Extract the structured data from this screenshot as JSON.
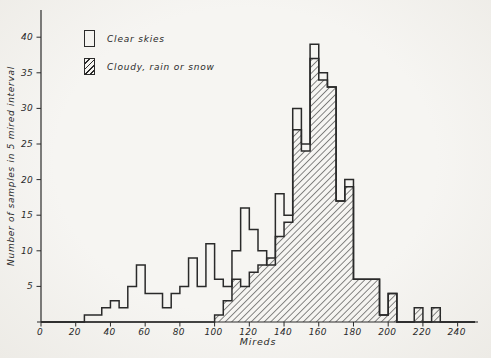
{
  "figure": {
    "ink": "#2a2a2a",
    "paper": "#f3f2ee"
  },
  "legend": {
    "items": [
      {
        "label": "Clear skies",
        "swatch": "open"
      },
      {
        "label": "Cloudy, rain or snow",
        "swatch": "hatched"
      }
    ]
  },
  "chart_data": {
    "type": "bar",
    "subtype": "overlaid step histograms",
    "title": "",
    "xlabel": "Mireds",
    "ylabel": "Number of samples in 5 mired interval",
    "bin_start": 0,
    "bin_width": 5,
    "xlim": [
      0,
      250
    ],
    "ylim": [
      0,
      43
    ],
    "x_ticks": [
      0,
      20,
      40,
      60,
      80,
      100,
      120,
      140,
      160,
      180,
      200,
      220,
      240
    ],
    "y_ticks": [
      5,
      10,
      15,
      20,
      25,
      30,
      35,
      40
    ],
    "grid": false,
    "legend_position": "upper-left",
    "series": [
      {
        "name": "Clear skies",
        "style": "open-outline",
        "values": [
          0,
          0,
          0,
          0,
          0,
          1,
          1,
          2,
          3,
          2,
          5,
          8,
          4,
          4,
          2,
          4,
          5,
          9,
          5,
          11,
          6,
          5,
          10,
          16,
          13,
          10,
          8,
          18,
          15,
          30,
          25,
          39,
          35,
          33,
          17,
          20,
          6,
          6,
          6,
          1,
          4,
          0,
          0,
          0,
          0,
          0,
          0,
          0,
          0,
          0
        ]
      },
      {
        "name": "Cloudy, rain or snow",
        "style": "hatched",
        "values": [
          0,
          0,
          0,
          0,
          0,
          0,
          0,
          0,
          0,
          0,
          0,
          0,
          0,
          0,
          0,
          0,
          0,
          0,
          0,
          0,
          1,
          3,
          6,
          5,
          7,
          8,
          9,
          12,
          14,
          27,
          24,
          37,
          34,
          33,
          17,
          19,
          6,
          6,
          6,
          1,
          4,
          0,
          0,
          2,
          0,
          2,
          0,
          0,
          0,
          0
        ]
      }
    ]
  }
}
